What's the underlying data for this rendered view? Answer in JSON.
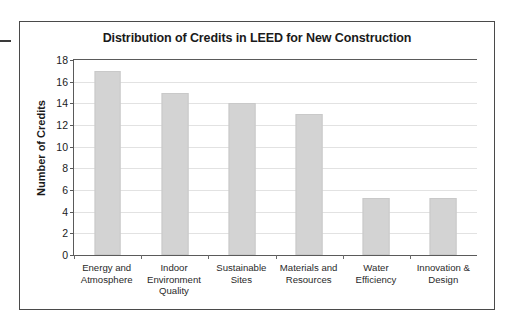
{
  "chart_data": {
    "type": "bar",
    "title": "Distribution of Credits in LEED for New Construction",
    "xlabel": "",
    "ylabel": "Number of Credits",
    "categories": [
      "Energy and Atmosphere",
      "Indoor Environment Quality",
      "Sustainable Sites",
      "Materials and Resources",
      "Water Efficiency",
      "Innovation & Design"
    ],
    "values": [
      17,
      15,
      14,
      13,
      5.3,
      5.3
    ],
    "ylim": [
      0,
      18
    ],
    "yticks": [
      0,
      2,
      4,
      6,
      8,
      10,
      12,
      14,
      16,
      18
    ],
    "ytick_labels": [
      "0",
      "2",
      "4",
      "6",
      "8",
      "10",
      "12",
      "14",
      "16",
      "18"
    ],
    "grid": true,
    "legend": false,
    "bar_color": "#d3d3d3",
    "bar_edge_color": "#c9c9c9",
    "grid_color": "#e2e2e2",
    "axis_color": "#5a5a5a",
    "text_color": "#1a1a1a",
    "background": "#ffffff"
  }
}
